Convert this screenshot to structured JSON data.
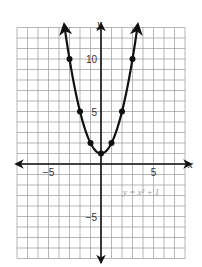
{
  "chart_data": {
    "type": "line",
    "title": "",
    "equation_label": "y = x² + 1",
    "xlabel": "x",
    "ylabel": "y",
    "xlim": [
      -8,
      8
    ],
    "ylim": [
      -9,
      13
    ],
    "grid": true,
    "x_ticks": [
      {
        "value": -5,
        "label": "−5"
      },
      {
        "value": 5,
        "label": "5"
      }
    ],
    "y_ticks": [
      {
        "value": 10,
        "label": "10"
      },
      {
        "value": 5,
        "label": "5"
      },
      {
        "value": -5,
        "label": "−5"
      }
    ],
    "series": [
      {
        "name": "y = x^2 + 1",
        "function": "x^2 + 1",
        "points": [
          {
            "x": -3,
            "y": 10
          },
          {
            "x": -2,
            "y": 5
          },
          {
            "x": -1,
            "y": 2
          },
          {
            "x": 0,
            "y": 1
          },
          {
            "x": 1,
            "y": 2
          },
          {
            "x": 2,
            "y": 5
          },
          {
            "x": 3,
            "y": 10
          }
        ]
      }
    ]
  }
}
